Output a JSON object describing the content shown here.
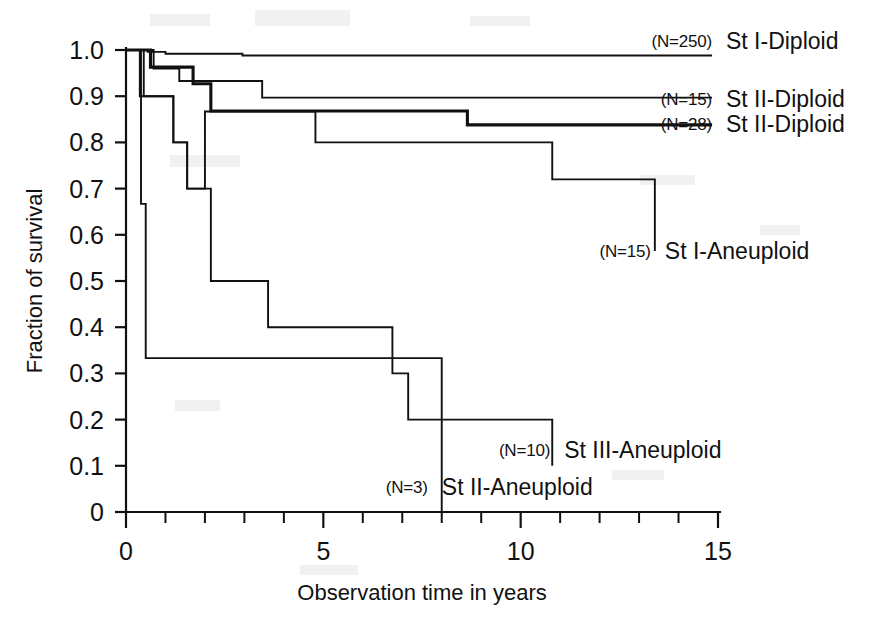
{
  "chart_data": {
    "type": "line",
    "title": "",
    "subtitle": "",
    "xlabel": "Observation time in years",
    "ylabel": "Fraction of survival",
    "xlim": [
      0,
      15
    ],
    "ylim": [
      0,
      1.0
    ],
    "x_ticks": [
      0,
      5,
      10,
      15
    ],
    "x_tick_labels": [
      "0",
      "5",
      "10",
      "15"
    ],
    "x_minor_step": 1,
    "y_ticks": [
      0,
      0.1,
      0.2,
      0.3,
      0.4,
      0.5,
      0.6,
      0.7,
      0.8,
      0.9,
      1.0
    ],
    "y_tick_labels": [
      "0",
      "0.1",
      "0.2",
      "0.3",
      "0.4",
      "0.5",
      "0.6",
      "0.7",
      "0.8",
      "0.9",
      "1.0"
    ],
    "grid": false,
    "legend_position": "inline-right-of-curve-ends",
    "style": "kaplan-meier step curves, black on white",
    "series": [
      {
        "name": "St I-Diploid",
        "n_label": "(N=250)",
        "n": 250,
        "label_x": 15.05,
        "label_y": 1.02,
        "stroke": "thin",
        "points": [
          [
            0.0,
            1.0
          ],
          [
            0.55,
            1.0
          ],
          [
            0.55,
            0.996
          ],
          [
            1.0,
            0.996
          ],
          [
            1.0,
            0.992
          ],
          [
            2.95,
            0.992
          ],
          [
            2.95,
            0.988
          ],
          [
            14.85,
            0.988
          ]
        ]
      },
      {
        "name": "St II-Diploid",
        "n_label": "(N=15)",
        "n": 15,
        "label_x": 15.05,
        "label_y": 0.895,
        "stroke": "thin",
        "points": [
          [
            0.0,
            1.0
          ],
          [
            0.7,
            1.0
          ],
          [
            0.7,
            0.96
          ],
          [
            1.35,
            0.96
          ],
          [
            1.35,
            0.933
          ],
          [
            3.45,
            0.933
          ],
          [
            3.45,
            0.897
          ],
          [
            14.85,
            0.897
          ]
        ]
      },
      {
        "name": "St II-Diploid",
        "n_label": "(N=28)",
        "n": 28,
        "label_x": 15.05,
        "label_y": 0.84,
        "stroke": "thick",
        "points": [
          [
            0.0,
            1.0
          ],
          [
            0.62,
            1.0
          ],
          [
            0.62,
            0.963
          ],
          [
            1.7,
            0.963
          ],
          [
            1.7,
            0.927
          ],
          [
            2.15,
            0.927
          ],
          [
            2.15,
            0.868
          ],
          [
            8.65,
            0.868
          ],
          [
            8.65,
            0.838
          ],
          [
            14.85,
            0.838
          ]
        ]
      },
      {
        "name": "St I-Aneuploid",
        "n_label": "(N=15)",
        "n": 15,
        "label_x": 13.5,
        "label_y": 0.565,
        "stroke": "thin",
        "points": [
          [
            0.0,
            1.0
          ],
          [
            0.35,
            1.0
          ],
          [
            0.35,
            0.9
          ],
          [
            1.2,
            0.9
          ],
          [
            1.2,
            0.8
          ],
          [
            1.55,
            0.8
          ],
          [
            1.55,
            0.7
          ],
          [
            2.0,
            0.7
          ],
          [
            2.0,
            0.867
          ],
          [
            4.8,
            0.867
          ],
          [
            4.8,
            0.8
          ],
          [
            10.8,
            0.8
          ],
          [
            10.8,
            0.72
          ],
          [
            13.4,
            0.72
          ],
          [
            13.4,
            0.565
          ]
        ]
      },
      {
        "name": "St III-Aneuploid",
        "n_label": "(N=10)",
        "n": 10,
        "label_x": 10.95,
        "label_y": 0.135,
        "stroke": "thin",
        "points": [
          [
            0.0,
            1.0
          ],
          [
            0.45,
            1.0
          ],
          [
            0.45,
            0.9
          ],
          [
            1.2,
            0.9
          ],
          [
            1.2,
            0.8
          ],
          [
            1.55,
            0.8
          ],
          [
            1.55,
            0.7
          ],
          [
            2.15,
            0.7
          ],
          [
            2.15,
            0.5
          ],
          [
            3.6,
            0.5
          ],
          [
            3.6,
            0.4
          ],
          [
            6.75,
            0.4
          ],
          [
            6.75,
            0.3
          ],
          [
            7.15,
            0.3
          ],
          [
            7.15,
            0.2
          ],
          [
            10.8,
            0.2
          ],
          [
            10.8,
            0.1
          ]
        ]
      },
      {
        "name": "St II-Aneuploid",
        "n_label": "(N=3)",
        "n": 3,
        "label_x": 7.85,
        "label_y": 0.055,
        "stroke": "thin",
        "points": [
          [
            0.0,
            1.0
          ],
          [
            0.38,
            1.0
          ],
          [
            0.38,
            0.667
          ],
          [
            0.5,
            0.667
          ],
          [
            0.5,
            0.333
          ],
          [
            8.0,
            0.333
          ],
          [
            8.0,
            0.0
          ]
        ]
      }
    ]
  }
}
